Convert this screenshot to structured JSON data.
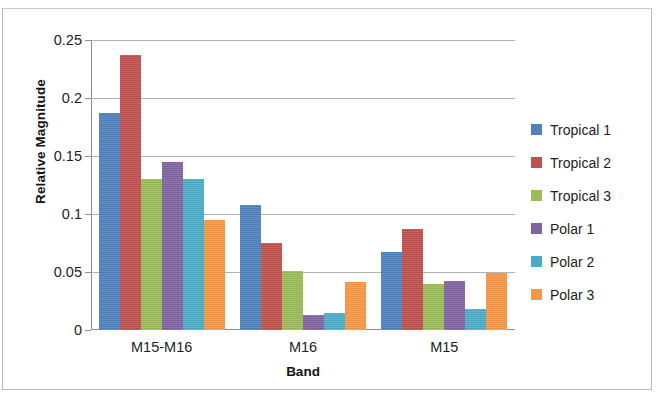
{
  "chart_data": {
    "type": "bar",
    "title": "",
    "xlabel": "Band",
    "ylabel": "Relative Magnitude",
    "categories": [
      "M15-M16",
      "M16",
      "M15"
    ],
    "ylim": [
      0,
      0.25
    ],
    "yticks": [
      "0",
      "0.05",
      "0.1",
      "0.15",
      "0.2",
      "0.25"
    ],
    "ytick_values": [
      0,
      0.05,
      0.1,
      0.15,
      0.2,
      0.25
    ],
    "grid": true,
    "legend_position": "right",
    "series": [
      {
        "name": "Tropical 1",
        "color": "#4f81bd",
        "values": [
          0.187,
          0.108,
          0.067
        ]
      },
      {
        "name": "Tropical 2",
        "color": "#c0504d",
        "values": [
          0.237,
          0.075,
          0.087
        ]
      },
      {
        "name": "Tropical 3",
        "color": "#9bbb59",
        "values": [
          0.13,
          0.051,
          0.04
        ]
      },
      {
        "name": "Polar 1",
        "color": "#8064a2",
        "values": [
          0.145,
          0.013,
          0.042
        ]
      },
      {
        "name": "Polar 2",
        "color": "#4bacc6",
        "values": [
          0.13,
          0.015,
          0.018
        ]
      },
      {
        "name": "Polar 3",
        "color": "#f79646",
        "values": [
          0.095,
          0.041,
          0.049
        ]
      }
    ]
  }
}
